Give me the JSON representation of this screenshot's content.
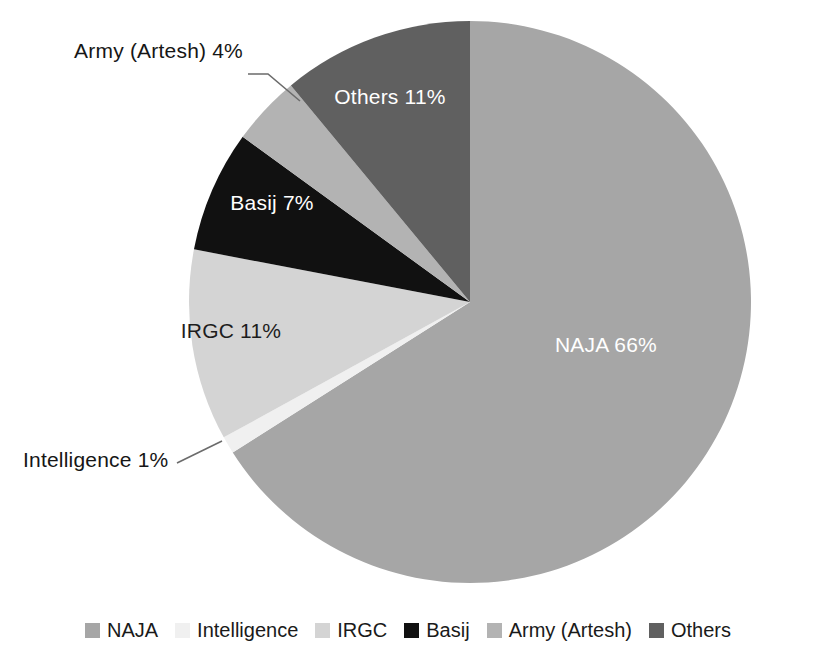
{
  "chart_data": {
    "type": "pie",
    "title": "",
    "subtitle": "",
    "xlabel": "",
    "ylabel": "",
    "grid": false,
    "legend_position": "bottom",
    "start_angle_deg": 0,
    "direction": "clockwise",
    "units": "percent",
    "categories": [
      "NAJA",
      "Intelligence",
      "IRGC",
      "Basij",
      "Army (Artesh)",
      "Others"
    ],
    "values": [
      66,
      1,
      11,
      7,
      4,
      11
    ],
    "labels": [
      "NAJA 66%",
      "Intelligence 1%",
      "IRGC 11%",
      "Basij 7%",
      "Army (Artesh) 4%",
      "Others 11%"
    ],
    "colors": [
      "#a6a6a6",
      "#f0f0f0",
      "#d4d4d4",
      "#111111",
      "#b3b3b3",
      "#606060"
    ],
    "slices": [
      {
        "name": "NAJA",
        "value": 66,
        "label": "NAJA 66%",
        "color": "#a6a6a6",
        "label_placement": "inside",
        "label_color": "#ffffff"
      },
      {
        "name": "Intelligence",
        "value": 1,
        "label": "Intelligence 1%",
        "color": "#f0f0f0",
        "label_placement": "outside",
        "label_color": "#161616"
      },
      {
        "name": "IRGC",
        "value": 11,
        "label": "IRGC 11%",
        "color": "#d4d4d4",
        "label_placement": "inside",
        "label_color": "#1d1d1d"
      },
      {
        "name": "Basij",
        "value": 7,
        "label": "Basij 7%",
        "color": "#111111",
        "label_placement": "inside",
        "label_color": "#ffffff"
      },
      {
        "name": "Army (Artesh)",
        "value": 4,
        "label": "Army (Artesh) 4%",
        "color": "#b3b3b3",
        "label_placement": "outside",
        "label_color": "#161616"
      },
      {
        "name": "Others",
        "value": 11,
        "label": "Others 11%",
        "color": "#606060",
        "label_placement": "inside",
        "label_color": "#ffffff"
      }
    ]
  },
  "legend": {
    "items": [
      {
        "label": "NAJA",
        "color": "#a6a6a6"
      },
      {
        "label": "Intelligence",
        "color": "#f0f0f0"
      },
      {
        "label": "IRGC",
        "color": "#d4d4d4"
      },
      {
        "label": "Basij",
        "color": "#111111"
      },
      {
        "label": "Army (Artesh)",
        "color": "#b3b3b3"
      },
      {
        "label": "Others",
        "color": "#606060"
      }
    ]
  }
}
